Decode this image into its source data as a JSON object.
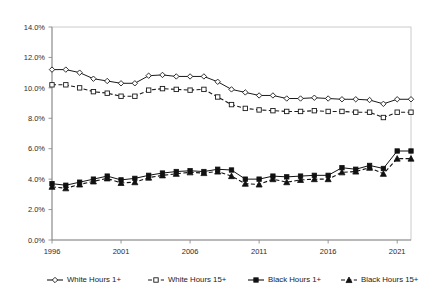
{
  "chart_data": {
    "type": "line",
    "title": "",
    "subtitle": "",
    "xlabel": "",
    "ylabel": "",
    "xlim": [
      1996,
      2022
    ],
    "ylim": [
      0,
      14
    ],
    "ytick_labels": [
      "0.0%",
      "2.0%",
      "4.0%",
      "6.0%",
      "8.0%",
      "10.0%",
      "12.0%",
      "14.0%"
    ],
    "ytick_values": [
      0,
      2,
      4,
      6,
      8,
      10,
      12,
      14
    ],
    "xtick_labels": [
      "1996",
      "2001",
      "2006",
      "2011",
      "2016",
      "2021"
    ],
    "xtick_values": [
      1996,
      2001,
      2006,
      2011,
      2016,
      2021
    ],
    "x": [
      1996,
      1997,
      1998,
      1999,
      2000,
      2001,
      2002,
      2003,
      2004,
      2005,
      2006,
      2007,
      2008,
      2009,
      2010,
      2011,
      2012,
      2013,
      2014,
      2015,
      2016,
      2017,
      2018,
      2019,
      2020,
      2021,
      2022
    ],
    "grid": false,
    "legend_position": "bottom",
    "units": "percent",
    "series": [
      {
        "name": "White Hours 1+",
        "marker": "diamond-open",
        "line_style": "solid",
        "color": "#1a1a1a",
        "values": [
          11.2,
          11.2,
          11.0,
          10.6,
          10.45,
          10.3,
          10.3,
          10.8,
          10.85,
          10.75,
          10.75,
          10.75,
          10.4,
          9.9,
          9.7,
          9.5,
          9.5,
          9.3,
          9.3,
          9.35,
          9.3,
          9.25,
          9.25,
          9.2,
          8.95,
          9.25,
          9.25
        ]
      },
      {
        "name": "White Hours 15+",
        "marker": "square-open",
        "line_style": "dashed",
        "color": "#1a1a1a",
        "values": [
          10.2,
          10.2,
          10.0,
          9.75,
          9.65,
          9.45,
          9.45,
          9.85,
          9.95,
          9.9,
          9.85,
          9.9,
          9.4,
          8.9,
          8.65,
          8.55,
          8.5,
          8.45,
          8.45,
          8.5,
          8.45,
          8.45,
          8.4,
          8.4,
          8.05,
          8.4,
          8.4
        ]
      },
      {
        "name": "Black Hours 1+",
        "marker": "square-filled",
        "line_style": "solid",
        "color": "#111111",
        "values": [
          3.7,
          3.6,
          3.8,
          4.0,
          4.2,
          3.95,
          4.05,
          4.25,
          4.4,
          4.5,
          4.55,
          4.5,
          4.65,
          4.6,
          4.0,
          4.0,
          4.2,
          4.15,
          4.2,
          4.25,
          4.25,
          4.75,
          4.65,
          4.9,
          4.7,
          5.85,
          5.85
        ]
      },
      {
        "name": "Black Hours 15+",
        "marker": "triangle-filled",
        "line_style": "dashed",
        "color": "#111111",
        "values": [
          3.5,
          3.4,
          3.65,
          3.85,
          4.05,
          3.75,
          3.8,
          4.1,
          4.25,
          4.35,
          4.45,
          4.4,
          4.5,
          4.2,
          3.7,
          3.65,
          4.0,
          3.8,
          3.95,
          4.0,
          4.0,
          4.45,
          4.5,
          4.75,
          4.35,
          5.35,
          5.35
        ]
      }
    ]
  },
  "legend": {
    "items": [
      {
        "label": "White Hours 1+",
        "marker": "diamond-open",
        "dash": "solid"
      },
      {
        "label": "White Hours 15+",
        "marker": "square-open",
        "dash": "dashed"
      },
      {
        "label": "Black Hours 1+",
        "marker": "square-filled",
        "dash": "solid"
      },
      {
        "label": "Black Hours 15+",
        "marker": "triangle-filled",
        "dash": "dashed"
      }
    ]
  },
  "colors": {
    "background": "#ffffff",
    "axis": "#8d8d8d",
    "border": "#bfbfbf",
    "text": "#2b2b2b",
    "series_white": "#1a1a1a",
    "series_black": "#111111"
  }
}
